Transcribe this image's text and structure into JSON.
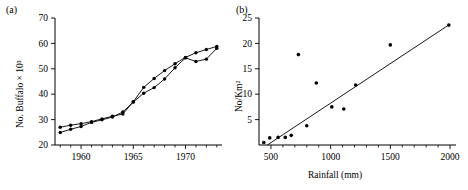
{
  "figure": {
    "panels": [
      {
        "id": "a",
        "label": "(a)",
        "ylabel": "No. Buffalo × 10³",
        "xlabel": ""
      },
      {
        "id": "b",
        "label": "(b)",
        "ylabel": "No/Km²",
        "xlabel": "Rainfall (mm)"
      }
    ]
  },
  "chart_data": [
    {
      "type": "line",
      "title": "",
      "panel": "(a)",
      "xlabel": "",
      "ylabel": "No. Buffalo × 10³",
      "xlim": [
        1957.5,
        1973.5
      ],
      "ylim": [
        20,
        70
      ],
      "xticks": [
        1960,
        1965,
        1970
      ],
      "xtick_labels": [
        "1960",
        "1965",
        "1970"
      ],
      "xminorticks": [
        1958,
        1959,
        1961,
        1962,
        1963,
        1964,
        1966,
        1967,
        1968,
        1969,
        1971,
        1972,
        1973
      ],
      "yticks": [
        20,
        30,
        40,
        50,
        60,
        70
      ],
      "ytick_labels": [
        "20",
        "30",
        "40",
        "50",
        "60",
        "70"
      ],
      "grid": false,
      "legend": "none",
      "marker": "filled-circle",
      "series": [
        {
          "name": "series-upper-early",
          "x": [
            1958,
            1959,
            1960,
            1961,
            1962,
            1963,
            1964,
            1965,
            1966,
            1967,
            1968,
            1969,
            1970,
            1971,
            1972,
            1973
          ],
          "values": [
            27.0,
            27.8,
            28.4,
            29.2,
            30.3,
            31.3,
            32.2,
            37.0,
            42.7,
            46.2,
            49.3,
            52.0,
            54.5,
            56.3,
            57.6,
            58.8
          ]
        },
        {
          "name": "series-lower-early",
          "x": [
            1958,
            1959,
            1960,
            1961,
            1962,
            1963,
            1964,
            1965,
            1966,
            1967,
            1968,
            1969,
            1970,
            1971,
            1972,
            1973
          ],
          "values": [
            24.9,
            26.2,
            27.3,
            28.9,
            29.9,
            31.0,
            33.0,
            36.9,
            40.4,
            42.6,
            46.0,
            50.4,
            54.3,
            52.9,
            53.8,
            58.1
          ]
        }
      ]
    },
    {
      "type": "scatter",
      "title": "",
      "panel": "(b)",
      "xlabel": "Rainfall (mm)",
      "ylabel": "No/Km²",
      "xlim": [
        400,
        2050
      ],
      "ylim": [
        0,
        25
      ],
      "xticks": [
        500,
        1000,
        1500,
        2000
      ],
      "xtick_labels": [
        "500",
        "1000",
        "1500",
        "2000"
      ],
      "xminorticks": [
        600,
        700,
        800,
        900,
        1100,
        1200,
        1300,
        1400,
        1600,
        1700,
        1800,
        1900
      ],
      "yticks": [
        5,
        10,
        15,
        20,
        25
      ],
      "ytick_labels": [
        "5",
        "10",
        "15",
        "20",
        "25"
      ],
      "grid": false,
      "legend": "none",
      "marker": "filled-circle",
      "points": [
        {
          "x": 440,
          "y": 0.5
        },
        {
          "x": 490,
          "y": 1.4
        },
        {
          "x": 560,
          "y": 1.5
        },
        {
          "x": 620,
          "y": 1.5
        },
        {
          "x": 670,
          "y": 1.9
        },
        {
          "x": 730,
          "y": 17.8
        },
        {
          "x": 800,
          "y": 3.8
        },
        {
          "x": 880,
          "y": 12.2
        },
        {
          "x": 1010,
          "y": 7.5
        },
        {
          "x": 1110,
          "y": 7.1
        },
        {
          "x": 1210,
          "y": 11.8
        },
        {
          "x": 1500,
          "y": 19.7
        },
        {
          "x": 1990,
          "y": 23.6
        }
      ],
      "fit_line": {
        "name": "regression-line",
        "x": [
          470,
          2000
        ],
        "y": [
          0.0,
          23.8
        ]
      }
    }
  ]
}
